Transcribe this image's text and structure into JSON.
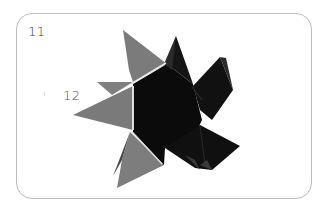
{
  "diagram": {
    "type": "origami-step-illustration",
    "steps": [
      {
        "number": "11",
        "position": "top-left"
      },
      {
        "number": "12",
        "position": "left"
      }
    ],
    "colors": {
      "frame": "#bdbdbd",
      "paper_gray": "#7a7a7a",
      "paper_dark": "#0a0a0a",
      "seam_light": "#e8e8e8",
      "background": "#ffffff"
    }
  }
}
